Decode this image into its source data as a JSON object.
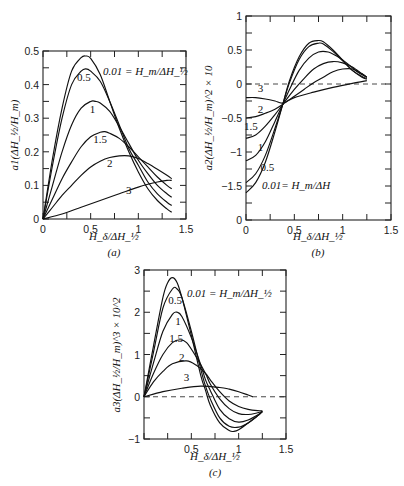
{
  "chart_data": [
    {
      "id": "a",
      "type": "line",
      "caption": "(a)",
      "xlabel": "H_δ/ΔH_½",
      "ylabel": "a1(ΔH_½/H_m)",
      "xlim": [
        0,
        1.5
      ],
      "ylim": [
        0,
        0.5
      ],
      "xticks": [
        0,
        0.5,
        1,
        1.5
      ],
      "yticks": [
        0,
        0.1,
        0.2,
        0.3,
        0.4,
        0.5
      ],
      "legend_annotation": "0.01 = H_m/ΔH_½",
      "series": [
        {
          "name": "0.01",
          "x": [
            0,
            0.1,
            0.2,
            0.3,
            0.4,
            0.45,
            0.5,
            0.6,
            0.7,
            0.8,
            0.9,
            1.0,
            1.1,
            1.2,
            1.3,
            1.35
          ],
          "y": [
            0,
            0.18,
            0.33,
            0.44,
            0.48,
            0.485,
            0.478,
            0.43,
            0.35,
            0.27,
            0.2,
            0.14,
            0.09,
            0.055,
            0.03,
            0.02
          ]
        },
        {
          "name": "0.5",
          "x": [
            0,
            0.1,
            0.2,
            0.3,
            0.4,
            0.45,
            0.5,
            0.6,
            0.7,
            0.8,
            0.9,
            1.0,
            1.1,
            1.2,
            1.3,
            1.35
          ],
          "y": [
            0,
            0.16,
            0.3,
            0.4,
            0.44,
            0.447,
            0.44,
            0.41,
            0.35,
            0.28,
            0.21,
            0.16,
            0.11,
            0.075,
            0.05,
            0.04
          ]
        },
        {
          "name": "1",
          "x": [
            0,
            0.1,
            0.2,
            0.3,
            0.4,
            0.5,
            0.55,
            0.6,
            0.7,
            0.8,
            0.9,
            1.0,
            1.1,
            1.2,
            1.3,
            1.35
          ],
          "y": [
            0,
            0.1,
            0.2,
            0.28,
            0.33,
            0.35,
            0.35,
            0.345,
            0.32,
            0.275,
            0.225,
            0.175,
            0.135,
            0.1,
            0.075,
            0.065
          ]
        },
        {
          "name": "1.5",
          "x": [
            0,
            0.1,
            0.2,
            0.3,
            0.4,
            0.5,
            0.6,
            0.65,
            0.7,
            0.8,
            0.9,
            1.0,
            1.1,
            1.2,
            1.3,
            1.35
          ],
          "y": [
            0,
            0.06,
            0.12,
            0.17,
            0.215,
            0.245,
            0.258,
            0.26,
            0.255,
            0.24,
            0.215,
            0.185,
            0.155,
            0.125,
            0.1,
            0.09
          ]
        },
        {
          "name": "2",
          "x": [
            0,
            0.1,
            0.2,
            0.3,
            0.4,
            0.5,
            0.6,
            0.7,
            0.8,
            0.9,
            1.0,
            1.1,
            1.2,
            1.3,
            1.35
          ],
          "y": [
            0,
            0.035,
            0.07,
            0.1,
            0.13,
            0.155,
            0.172,
            0.183,
            0.188,
            0.188,
            0.18,
            0.165,
            0.148,
            0.13,
            0.12
          ]
        },
        {
          "name": "3",
          "x": [
            0,
            0.2,
            0.4,
            0.6,
            0.8,
            1.0,
            1.2,
            1.3,
            1.35
          ],
          "y": [
            0,
            0.015,
            0.035,
            0.055,
            0.075,
            0.095,
            0.11,
            0.115,
            0.115
          ]
        }
      ],
      "curve_labels": [
        {
          "text": "0.5",
          "x": 0.43,
          "y": 0.41
        },
        {
          "text": "1",
          "x": 0.52,
          "y": 0.315
        },
        {
          "text": "1.5",
          "x": 0.6,
          "y": 0.225
        },
        {
          "text": "2",
          "x": 0.7,
          "y": 0.155
        },
        {
          "text": "3",
          "x": 0.9,
          "y": 0.075
        }
      ]
    },
    {
      "id": "b",
      "type": "line",
      "caption": "(b)",
      "xlabel": "H_δ/ΔH_½",
      "ylabel": "a2(ΔH_½/H_m)^2 × 10",
      "xlim": [
        0,
        1.5
      ],
      "ylim": [
        -2,
        1
      ],
      "xticks": [
        0,
        0.5,
        1,
        1.5
      ],
      "yticks": [
        1,
        0.5,
        0,
        -0.5,
        -1,
        -1.5,
        -2
      ],
      "ytick_labels": [
        "1",
        "0.5",
        "0",
        "−0.5",
        "−1",
        "−1.5",
        "0"
      ],
      "reference_line": {
        "y": 0,
        "style": "dashed"
      },
      "legend_annotation": "0.01= H_m/ΔH",
      "series": [
        {
          "name": "0.01",
          "x": [
            0,
            0.1,
            0.2,
            0.3,
            0.38,
            0.45,
            0.55,
            0.65,
            0.75,
            0.8,
            0.9,
            1.0,
            1.1,
            1.2,
            1.25
          ],
          "y": [
            -1.6,
            -1.45,
            -1.15,
            -0.7,
            -0.3,
            0.05,
            0.4,
            0.6,
            0.64,
            0.62,
            0.5,
            0.35,
            0.2,
            0.1,
            0.07
          ]
        },
        {
          "name": "0.5",
          "x": [
            0,
            0.1,
            0.2,
            0.3,
            0.38,
            0.45,
            0.55,
            0.65,
            0.75,
            0.8,
            0.9,
            1.0,
            1.1,
            1.2,
            1.25
          ],
          "y": [
            -1.45,
            -1.32,
            -1.05,
            -0.65,
            -0.3,
            0.02,
            0.36,
            0.55,
            0.6,
            0.59,
            0.48,
            0.34,
            0.2,
            0.11,
            0.08
          ]
        },
        {
          "name": "1",
          "x": [
            0,
            0.1,
            0.2,
            0.3,
            0.38,
            0.45,
            0.55,
            0.65,
            0.75,
            0.85,
            0.95,
            1.05,
            1.15,
            1.25
          ],
          "y": [
            -1.13,
            -1.05,
            -0.85,
            -0.55,
            -0.3,
            -0.08,
            0.2,
            0.38,
            0.47,
            0.47,
            0.4,
            0.3,
            0.18,
            0.1
          ]
        },
        {
          "name": "1.5",
          "x": [
            0,
            0.1,
            0.2,
            0.3,
            0.38,
            0.5,
            0.6,
            0.7,
            0.8,
            0.9,
            1.0,
            1.1,
            1.2,
            1.25
          ],
          "y": [
            -0.8,
            -0.75,
            -0.62,
            -0.45,
            -0.3,
            -0.08,
            0.08,
            0.22,
            0.3,
            0.33,
            0.31,
            0.25,
            0.15,
            0.1
          ]
        },
        {
          "name": "2",
          "x": [
            0,
            0.1,
            0.2,
            0.3,
            0.38,
            0.5,
            0.6,
            0.7,
            0.8,
            0.9,
            1.0,
            1.1,
            1.2,
            1.25
          ],
          "y": [
            -0.5,
            -0.48,
            -0.43,
            -0.37,
            -0.3,
            -0.18,
            -0.08,
            0.02,
            0.1,
            0.18,
            0.22,
            0.22,
            0.15,
            0.1
          ]
        },
        {
          "name": "3",
          "x": [
            0,
            0.1,
            0.2,
            0.3,
            0.38,
            0.5,
            0.7,
            0.9,
            1.1,
            1.25
          ],
          "y": [
            -0.2,
            -0.2,
            -0.22,
            -0.25,
            -0.28,
            -0.2,
            -0.12,
            -0.05,
            0.01,
            0.05
          ]
        }
      ],
      "curve_labels": [
        {
          "text": "3",
          "x": 0.15,
          "y": -0.12
        },
        {
          "text": "2",
          "x": 0.15,
          "y": -0.42
        },
        {
          "text": "1.5",
          "x": 0.05,
          "y": -0.68
        },
        {
          "text": "1",
          "x": 0.15,
          "y": -0.98
        },
        {
          "text": "0.5",
          "x": 0.22,
          "y": -1.28
        }
      ]
    },
    {
      "id": "c",
      "type": "line",
      "caption": "(c)",
      "xlabel": "H_δ/ΔH_½",
      "ylabel": "a3(ΔH_½/H_m)^3 × 10^2",
      "xlim": [
        0,
        1.5
      ],
      "ylim": [
        -1,
        3
      ],
      "xticks": [
        0.5,
        1,
        1.5
      ],
      "yticks": [
        -1,
        0,
        1,
        2,
        3
      ],
      "reference_line": {
        "y": 0,
        "style": "dashed"
      },
      "legend_annotation": "0.01 = H_m/ΔH_½",
      "series": [
        {
          "name": "0.01",
          "x": [
            0,
            0.1,
            0.2,
            0.25,
            0.3,
            0.35,
            0.4,
            0.5,
            0.6,
            0.65,
            0.7,
            0.8,
            0.9,
            0.95,
            1.0,
            1.1,
            1.2,
            1.25
          ],
          "y": [
            0,
            1.2,
            2.35,
            2.7,
            2.82,
            2.7,
            2.35,
            1.45,
            0.5,
            0.15,
            -0.2,
            -0.62,
            -0.8,
            -0.82,
            -0.78,
            -0.62,
            -0.45,
            -0.35
          ]
        },
        {
          "name": "0.5",
          "x": [
            0,
            0.1,
            0.2,
            0.3,
            0.35,
            0.4,
            0.5,
            0.6,
            0.65,
            0.7,
            0.8,
            0.9,
            1.0,
            1.1,
            1.2,
            1.25
          ],
          "y": [
            0,
            1.05,
            2.1,
            2.55,
            2.55,
            2.35,
            1.55,
            0.65,
            0.25,
            -0.05,
            -0.5,
            -0.7,
            -0.72,
            -0.62,
            -0.45,
            -0.35
          ]
        },
        {
          "name": "1",
          "x": [
            0,
            0.1,
            0.2,
            0.3,
            0.35,
            0.4,
            0.5,
            0.6,
            0.65,
            0.7,
            0.8,
            0.9,
            1.0,
            1.1,
            1.2,
            1.25
          ],
          "y": [
            0,
            0.8,
            1.55,
            1.95,
            2.0,
            1.9,
            1.4,
            0.75,
            0.4,
            0.15,
            -0.3,
            -0.52,
            -0.6,
            -0.55,
            -0.43,
            -0.35
          ]
        },
        {
          "name": "1.5",
          "x": [
            0,
            0.1,
            0.2,
            0.3,
            0.38,
            0.45,
            0.55,
            0.65,
            0.7,
            0.8,
            0.9,
            1.0,
            1.1,
            1.2,
            1.25
          ],
          "y": [
            0,
            0.55,
            1.0,
            1.28,
            1.35,
            1.28,
            0.95,
            0.55,
            0.3,
            -0.05,
            -0.28,
            -0.4,
            -0.42,
            -0.38,
            -0.35
          ]
        },
        {
          "name": "2",
          "x": [
            0,
            0.1,
            0.2,
            0.3,
            0.45,
            0.55,
            0.65,
            0.7,
            0.8,
            0.9,
            1.0,
            1.1,
            1.2,
            1.25
          ],
          "y": [
            0,
            0.35,
            0.6,
            0.78,
            0.85,
            0.75,
            0.55,
            0.4,
            0.12,
            -0.1,
            -0.23,
            -0.3,
            -0.33,
            -0.33
          ]
        },
        {
          "name": "3",
          "x": [
            0,
            0.2,
            0.4,
            0.6,
            0.8,
            0.9,
            1.0,
            1.1,
            1.15
          ],
          "y": [
            0,
            0.12,
            0.2,
            0.25,
            0.22,
            0.18,
            0.12,
            0.04,
            0.0
          ]
        }
      ],
      "curve_labels": [
        {
          "text": "0.5",
          "x": 0.33,
          "y": 2.2
        },
        {
          "text": "1",
          "x": 0.36,
          "y": 1.7
        },
        {
          "text": "1.5",
          "x": 0.34,
          "y": 1.3
        },
        {
          "text": "2",
          "x": 0.4,
          "y": 0.85
        },
        {
          "text": "3",
          "x": 0.45,
          "y": 0.38
        }
      ]
    }
  ]
}
